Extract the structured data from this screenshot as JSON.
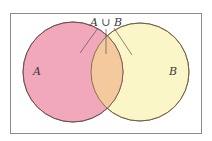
{
  "diagram": {
    "type": "venn",
    "title_label": "A ∪ B",
    "sets": [
      {
        "name": "A",
        "label": "A",
        "color": "#f2a8bb"
      },
      {
        "name": "B",
        "label": "B",
        "color": "#fbf6c8"
      }
    ],
    "intersection_color": "#f5c99e",
    "border_color": "#8a8a8a"
  }
}
